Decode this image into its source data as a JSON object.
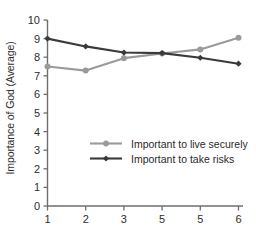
{
  "chart_data": {
    "type": "line",
    "title": "",
    "subtitle": "",
    "xlabel": "",
    "ylabel": "Importance of God (Average)",
    "categories": [
      "1",
      "2",
      "3",
      "5",
      "5",
      "6"
    ],
    "x": [
      1,
      2,
      3,
      4,
      5,
      6
    ],
    "xtick_labels": [
      "1",
      "2",
      "3",
      "5",
      "5",
      "6"
    ],
    "ytick_labels": [
      "0",
      "1",
      "2",
      "3",
      "4",
      "5",
      "6",
      "7",
      "8",
      "9",
      "10"
    ],
    "ylim": [
      0,
      10
    ],
    "xlim": [
      1,
      6
    ],
    "grid": false,
    "legend_position": "inside-center-left",
    "series": [
      {
        "name": "Important to live securely",
        "color": "#9a9a9a",
        "marker": "circle",
        "values": [
          7.5,
          7.28,
          7.95,
          8.2,
          8.42,
          9.05
        ]
      },
      {
        "name": "Important to take risks",
        "color": "#3a3a3a",
        "marker": "diamond",
        "values": [
          9.0,
          8.58,
          8.25,
          8.22,
          7.97,
          7.65
        ]
      }
    ],
    "annotations": []
  },
  "legend": {
    "items": [
      {
        "label": "Important to live securely"
      },
      {
        "label": "Important to take risks"
      }
    ]
  },
  "axis": {
    "y_title": "Importance of God (Average)",
    "y_ticks": [
      "10",
      "9",
      "8",
      "7",
      "6",
      "5",
      "4",
      "3",
      "2",
      "1",
      "0"
    ],
    "x_ticks": [
      "1",
      "2",
      "3",
      "5",
      "5",
      "6"
    ]
  },
  "colors": {
    "series_light": "#9a9a9a",
    "series_dark": "#3a3a3a",
    "axis": "#6e6e6e",
    "text": "#2d2d2d",
    "background": "#ffffff"
  }
}
